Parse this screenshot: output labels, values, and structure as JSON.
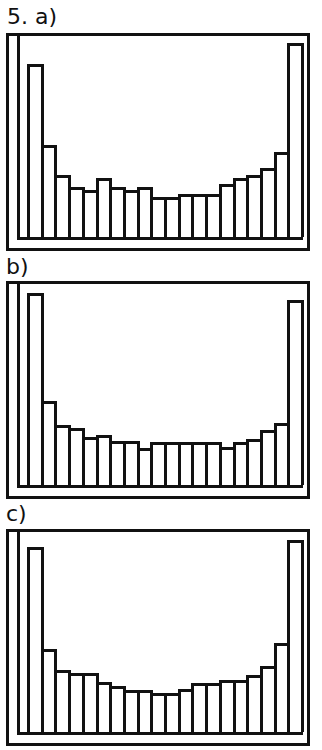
{
  "figure": {
    "number_label": "5.",
    "panels": [
      {
        "label": "a)"
      },
      {
        "label": "b)"
      },
      {
        "label": "c)"
      }
    ]
  },
  "chart_data": [
    {
      "type": "bar",
      "title": "5. a)",
      "xlabel": "",
      "ylabel": "",
      "categories": [
        "1",
        "2",
        "3",
        "4",
        "5",
        "6",
        "7",
        "8",
        "9",
        "10",
        "11",
        "12",
        "13",
        "14",
        "15",
        "16",
        "17",
        "18",
        "19",
        "20"
      ],
      "values": [
        176,
        93,
        63,
        51,
        48,
        60,
        51,
        48,
        51,
        41,
        41,
        44,
        44,
        44,
        54,
        60,
        63,
        70,
        86,
        197
      ],
      "ylim": [
        0,
        200
      ],
      "grid": false,
      "legend": "none",
      "note": "U-shaped histogram; bar heights in relative pixel units"
    },
    {
      "type": "bar",
      "title": "b)",
      "xlabel": "",
      "ylabel": "",
      "categories": [
        "1",
        "2",
        "3",
        "4",
        "5",
        "6",
        "7",
        "8",
        "9",
        "10",
        "11",
        "12",
        "13",
        "14",
        "15",
        "16",
        "17",
        "18",
        "19",
        "20"
      ],
      "values": [
        200,
        87,
        62,
        59,
        50,
        52,
        46,
        46,
        38,
        45,
        45,
        45,
        45,
        45,
        40,
        45,
        48,
        57,
        64,
        192
      ],
      "ylim": [
        0,
        205
      ],
      "grid": false,
      "legend": "none",
      "note": "U-shaped histogram; bar heights in relative pixel units"
    },
    {
      "type": "bar",
      "title": "c)",
      "xlabel": "",
      "ylabel": "",
      "categories": [
        "1",
        "2",
        "3",
        "4",
        "5",
        "6",
        "7",
        "8",
        "9",
        "10",
        "11",
        "12",
        "13",
        "14",
        "15",
        "16",
        "17",
        "18",
        "19",
        "20"
      ],
      "values": [
        189,
        85,
        63,
        60,
        60,
        51,
        47,
        43,
        43,
        40,
        40,
        44,
        50,
        50,
        53,
        53,
        58,
        67,
        91,
        196
      ],
      "ylim": [
        0,
        200
      ],
      "grid": false,
      "legend": "none",
      "note": "U-shaped histogram; bar heights in relative pixel units"
    }
  ]
}
